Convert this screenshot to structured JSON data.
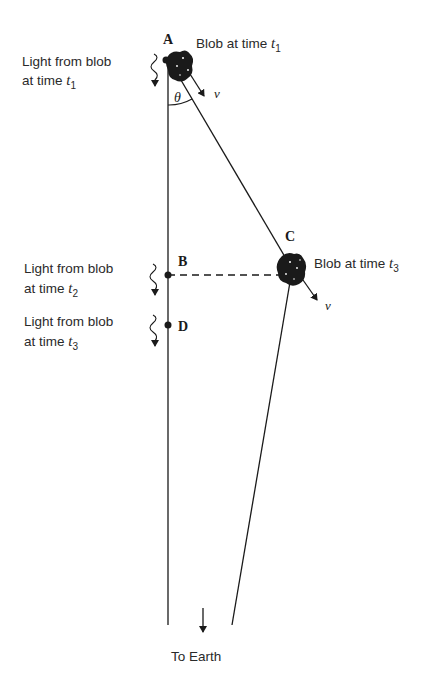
{
  "diagram": {
    "points": {
      "A": "A",
      "B": "B",
      "C": "C",
      "D": "D"
    },
    "angle_label": "θ",
    "velocity_label": "v",
    "blob_t1": {
      "text": "Blob at time ",
      "var": "t",
      "sub": "1"
    },
    "blob_t3": {
      "text": "Blob at time ",
      "var": "t",
      "sub": "3"
    },
    "light_t1": {
      "line1": "Light from blob",
      "line2": "at time ",
      "var": "t",
      "sub": "1"
    },
    "light_t2": {
      "line1": "Light from blob",
      "line2": "at time ",
      "var": "t",
      "sub": "2"
    },
    "light_t3": {
      "line1": "Light from blob",
      "line2": "at time ",
      "var": "t",
      "sub": "3"
    },
    "to_earth": "To Earth",
    "colors": {
      "ink": "#1a1a1a",
      "background": "#ffffff"
    }
  }
}
